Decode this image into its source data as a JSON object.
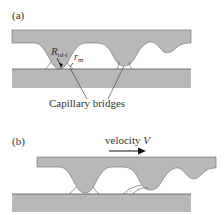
{
  "panel_a": {
    "label": "(a)",
    "radius_label_main": "R",
    "radius_label_sub": "td-i",
    "meniscus_label_main": "r",
    "meniscus_label_sub": "m",
    "callout": "Capillary bridges"
  },
  "panel_b": {
    "label": "(b)",
    "velocity_label": "velocity V",
    "velocity_label_prefix": "velocity ",
    "velocity_symbol": "V"
  },
  "colors": {
    "surface_fill": "#b8b8b8",
    "outline": "#555555",
    "text": "#333333"
  }
}
